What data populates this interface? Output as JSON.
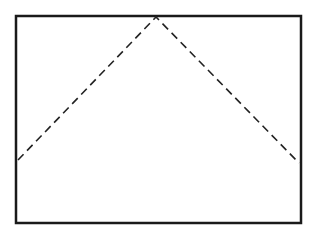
{
  "diagram": {
    "frame": {
      "x": 16,
      "y": 16,
      "width": 285,
      "height": 207,
      "stroke": "#1a1a1a",
      "stroke_width": 2.5
    },
    "dashed_path": {
      "points": [
        [
          18,
          160
        ],
        [
          156,
          17
        ],
        [
          299,
          163
        ]
      ],
      "stroke": "#222222",
      "stroke_width": 1.6,
      "dash": "8 5"
    },
    "colors": {
      "background": "#ffffff",
      "line": "#1a1a1a"
    }
  }
}
